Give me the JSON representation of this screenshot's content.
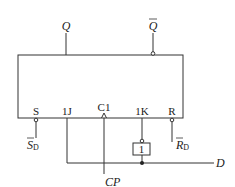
{
  "diagram": {
    "type": "JK flip-flop wired as D flip-flop",
    "colors": {
      "line": "#333333",
      "background": "#ffffff"
    },
    "outputs": {
      "q": "Q",
      "q_bar": "Q"
    },
    "pins": {
      "s": "S",
      "j": "1J",
      "clk": "C1",
      "k": "1K",
      "r": "R"
    },
    "inputs": {
      "sd_main": "S",
      "sd_sub": "D",
      "rd_main": "R",
      "rd_sub": "D",
      "cp": "CP",
      "d": "D"
    },
    "inverter": {
      "label": "1"
    }
  }
}
